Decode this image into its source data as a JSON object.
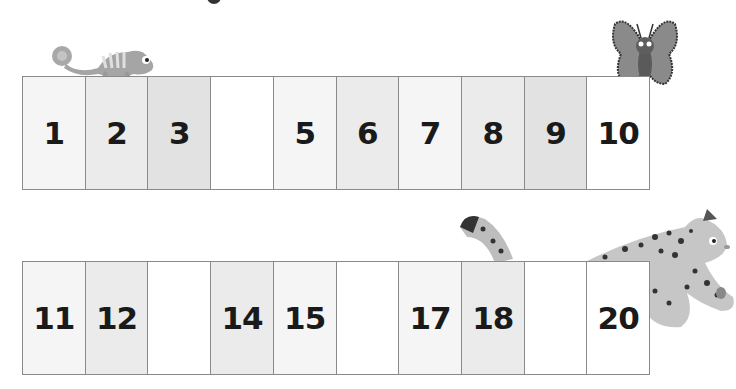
{
  "rows": [
    {
      "cells": [
        {
          "label": "1",
          "shade": "lighter"
        },
        {
          "label": "2",
          "shade": "light"
        },
        {
          "label": "3",
          "shade": "mid"
        },
        {
          "label": "",
          "shade": "white"
        },
        {
          "label": "5",
          "shade": "lighter"
        },
        {
          "label": "6",
          "shade": "light"
        },
        {
          "label": "7",
          "shade": "lighter"
        },
        {
          "label": "8",
          "shade": "light"
        },
        {
          "label": "9",
          "shade": "mid"
        },
        {
          "label": "10",
          "shade": "white"
        }
      ]
    },
    {
      "cells": [
        {
          "label": "11",
          "shade": "lighter"
        },
        {
          "label": "12",
          "shade": "light"
        },
        {
          "label": "",
          "shade": "white"
        },
        {
          "label": "14",
          "shade": "light"
        },
        {
          "label": "15",
          "shade": "lighter"
        },
        {
          "label": "",
          "shade": "white"
        },
        {
          "label": "17",
          "shade": "lighter"
        },
        {
          "label": "18",
          "shade": "light"
        },
        {
          "label": "",
          "shade": "white"
        },
        {
          "label": "20",
          "shade": "white"
        }
      ]
    }
  ],
  "illustrations": {
    "chameleon": "chameleon-illustration",
    "butterfly": "butterfly-illustration",
    "leopard": "leopard-illustration"
  }
}
